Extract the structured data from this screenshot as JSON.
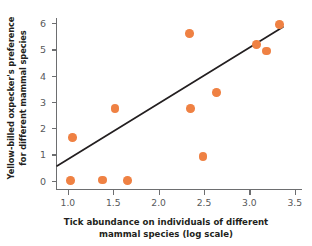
{
  "chart_data": {
    "type": "scatter",
    "title": "",
    "xlabel": "Tick abundance on individuals of different mammal species (log scale)",
    "xlabel_lines": [
      "Tick abundance on individuals of different",
      "mammal species (log scale)"
    ],
    "ylabel": "Yellow-billed oxpecker's preference for different mammal species",
    "ylabel_lines": [
      "Yellow-billed oxpecker's preference",
      "for different mammal species"
    ],
    "xlim": [
      0.88,
      3.58
    ],
    "ylim": [
      -0.32,
      6.2
    ],
    "xticks": [
      1.0,
      1.5,
      2.0,
      2.5,
      3.0,
      3.5
    ],
    "xticklabels": [
      "1.0",
      "1.5",
      "2.0",
      "2.5",
      "3.0",
      "3.5"
    ],
    "yticks": [
      0,
      1,
      2,
      3,
      4,
      5,
      6
    ],
    "yticklabels": [
      "0",
      "1",
      "2",
      "3",
      "4",
      "5",
      "6"
    ],
    "grid": false,
    "legend": null,
    "point_color": "#ef8143",
    "line_color": "#231f20",
    "axis_color": "#6d6e70",
    "points": [
      {
        "x": 1.03,
        "y": 0.0
      },
      {
        "x": 1.05,
        "y": 1.65
      },
      {
        "x": 1.38,
        "y": 0.03
      },
      {
        "x": 1.52,
        "y": 2.75
      },
      {
        "x": 1.66,
        "y": 0.0
      },
      {
        "x": 2.34,
        "y": 5.62
      },
      {
        "x": 2.35,
        "y": 2.74
      },
      {
        "x": 2.49,
        "y": 0.91
      },
      {
        "x": 2.64,
        "y": 3.36
      },
      {
        "x": 3.08,
        "y": 5.2
      },
      {
        "x": 3.19,
        "y": 4.94
      },
      {
        "x": 3.33,
        "y": 5.95
      }
    ],
    "trendline": {
      "x_start": 0.88,
      "y_start": 0.56,
      "x_end": 3.37,
      "y_end": 5.86
    }
  }
}
